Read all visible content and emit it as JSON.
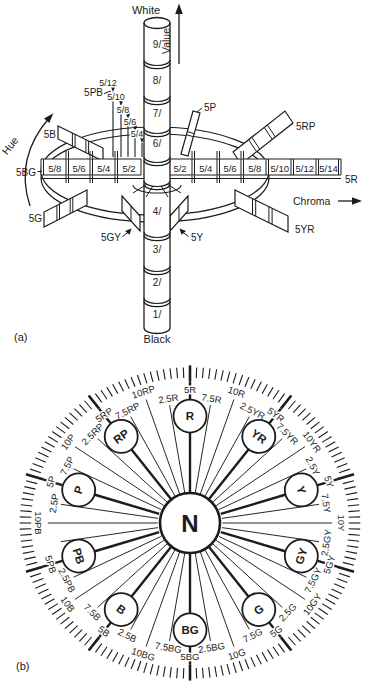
{
  "colors": {
    "ink": "#1c1c1c",
    "paper": "#ffffff"
  },
  "part_a": {
    "tag": "(a)",
    "labels": {
      "white": "White",
      "black": "Black",
      "value_axis": "Value",
      "hue_axis": "Hue",
      "chroma_axis": "Chroma",
      "hue_right_end": "5R",
      "hue_left_end": "5BG"
    },
    "value_segments_top": [
      "9/",
      "8/",
      "7/",
      "6/"
    ],
    "value_segments_bottom": [
      "4/",
      "3/",
      "2/",
      "1/"
    ],
    "chroma_cells_left": [
      "5/8",
      "5/6",
      "5/4",
      "5/2"
    ],
    "chroma_cells_right": [
      "5/2",
      "5/4",
      "5/6",
      "5/8",
      "5/10",
      "5/12",
      "5/14"
    ],
    "pb_plane": {
      "label": "5PB",
      "chroma_scale": [
        "5/12",
        "5/10",
        "5/8",
        "5/6",
        "5/4"
      ]
    },
    "hue_planes": {
      "b": "5B",
      "g": "5G",
      "gy": "5GY",
      "y": "5Y",
      "yr": "5YR",
      "rp": "5RP",
      "p": "5P"
    }
  },
  "part_b": {
    "tag": "(b)",
    "center_label": "N",
    "hue_circles": [
      {
        "label": "R",
        "angle": 0
      },
      {
        "label": "YR",
        "angle": 36
      },
      {
        "label": "Y",
        "angle": 72
      },
      {
        "label": "GY",
        "angle": 108
      },
      {
        "label": "G",
        "angle": 144
      },
      {
        "label": "BG",
        "angle": 180
      },
      {
        "label": "B",
        "angle": 216
      },
      {
        "label": "PB",
        "angle": 252
      },
      {
        "label": "P",
        "angle": 288
      },
      {
        "label": "RP",
        "angle": 324
      }
    ],
    "ring_labels": [
      {
        "text": "5R",
        "angle": 0,
        "kind": "5"
      },
      {
        "text": "7.5R",
        "angle": 9,
        "kind": "7.5"
      },
      {
        "text": "10R",
        "angle": 18,
        "kind": "10"
      },
      {
        "text": "2.5YR",
        "angle": 27,
        "kind": "2.5"
      },
      {
        "text": "5YR",
        "angle": 36,
        "kind": "5"
      },
      {
        "text": "7.5YR",
        "angle": 45,
        "kind": "7.5"
      },
      {
        "text": "10YR",
        "angle": 54,
        "kind": "10"
      },
      {
        "text": "2.5Y",
        "angle": 63,
        "kind": "2.5"
      },
      {
        "text": "5Y",
        "angle": 72,
        "kind": "5"
      },
      {
        "text": "7.5Y",
        "angle": 81,
        "kind": "7.5"
      },
      {
        "text": "10Y",
        "angle": 90,
        "kind": "10"
      },
      {
        "text": "2.5GY",
        "angle": 99,
        "kind": "2.5"
      },
      {
        "text": "5GY",
        "angle": 108,
        "kind": "5"
      },
      {
        "text": "7.5GY",
        "angle": 117,
        "kind": "7.5"
      },
      {
        "text": "10GY",
        "angle": 126,
        "kind": "10"
      },
      {
        "text": "2.5G",
        "angle": 135,
        "kind": "2.5"
      },
      {
        "text": "5G",
        "angle": 144,
        "kind": "5"
      },
      {
        "text": "7.5G",
        "angle": 153,
        "kind": "7.5"
      },
      {
        "text": "10G",
        "angle": 162,
        "kind": "10"
      },
      {
        "text": "2.5BG",
        "angle": 171,
        "kind": "2.5"
      },
      {
        "text": "5BG",
        "angle": 180,
        "kind": "5"
      },
      {
        "text": "7.5BG",
        "angle": 189,
        "kind": "7.5"
      },
      {
        "text": "10BG",
        "angle": 198,
        "kind": "10"
      },
      {
        "text": "2.5B",
        "angle": 207,
        "kind": "2.5"
      },
      {
        "text": "5B",
        "angle": 216,
        "kind": "5"
      },
      {
        "text": "7.5B",
        "angle": 225,
        "kind": "7.5"
      },
      {
        "text": "10B",
        "angle": 234,
        "kind": "10"
      },
      {
        "text": "2.5PB",
        "angle": 243,
        "kind": "2.5"
      },
      {
        "text": "5PB",
        "angle": 252,
        "kind": "5"
      },
      {
        "text": "7.5PB",
        "angle": 261,
        "kind": "7.5",
        "visible": false
      },
      {
        "text": "10PB",
        "angle": 270,
        "kind": "10"
      },
      {
        "text": "2.5P",
        "angle": 279,
        "kind": "2.5"
      },
      {
        "text": "5P",
        "angle": 288,
        "kind": "5"
      },
      {
        "text": "7.5P",
        "angle": 297,
        "kind": "7.5"
      },
      {
        "text": "10P",
        "angle": 306,
        "kind": "10"
      },
      {
        "text": "2.5RP",
        "angle": 315,
        "kind": "2.5"
      },
      {
        "text": "5RP",
        "angle": 324,
        "kind": "5"
      },
      {
        "text": "7.5RP",
        "angle": 333,
        "kind": "7.5"
      },
      {
        "text": "10RP",
        "angle": 342,
        "kind": "10"
      },
      {
        "text": "2.5R",
        "angle": 351,
        "kind": "2.5"
      }
    ]
  }
}
